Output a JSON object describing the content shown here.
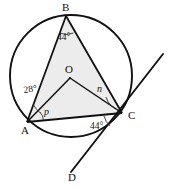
{
  "figure": {
    "type": "circle-geometry-diagram",
    "fill_color": "#ececec",
    "stroke_color": "#111111",
    "background_color": "#ffffff",
    "points": [
      {
        "id": "A",
        "label": "A",
        "x": 27,
        "y": 122,
        "label_x": 21,
        "label_y": 134
      },
      {
        "id": "B",
        "label": "B",
        "x": 66,
        "y": 16,
        "label_x": 62,
        "label_y": 11
      },
      {
        "id": "C",
        "label": "C",
        "x": 122,
        "y": 113,
        "label_x": 128,
        "label_y": 119
      },
      {
        "id": "O",
        "label": "O",
        "x": 70,
        "y": 78,
        "label_x": 65,
        "label_y": 73
      },
      {
        "id": "D",
        "label": "D",
        "x": 75,
        "y": 172,
        "label_x": 68,
        "label_y": 181
      }
    ],
    "circle": {
      "cx": 71,
      "cy": 76,
      "r": 61
    },
    "angles": [
      {
        "id": "angle-b",
        "vertex": "B",
        "value": "44°",
        "x": 57,
        "y": 40
      },
      {
        "id": "angle-a-oab",
        "vertex": "A",
        "value": "28°",
        "x": 24,
        "y": 93
      },
      {
        "id": "angle-a-p",
        "vertex": "A",
        "value": "p",
        "x": 44,
        "y": 115,
        "variable": true
      },
      {
        "id": "angle-c-n",
        "vertex": "C",
        "value": "n",
        "x": 97,
        "y": 92,
        "variable": true
      },
      {
        "id": "angle-c-tangent",
        "vertex": "C",
        "value": "44°",
        "x": 90,
        "y": 129
      }
    ],
    "segments": [
      {
        "id": "segment-AB",
        "from": "A",
        "to": "B"
      },
      {
        "id": "segment-BC",
        "from": "B",
        "to": "C"
      },
      {
        "id": "segment-AC",
        "from": "A",
        "to": "C"
      },
      {
        "id": "segment-OA",
        "from": "O",
        "to": "A"
      },
      {
        "id": "segment-OC",
        "from": "O",
        "to": "C"
      }
    ],
    "tangent_line": {
      "id": "tangent-through-C-and-D",
      "x1": 163,
      "y1": 54,
      "x2": 71,
      "y2": 172
    }
  }
}
